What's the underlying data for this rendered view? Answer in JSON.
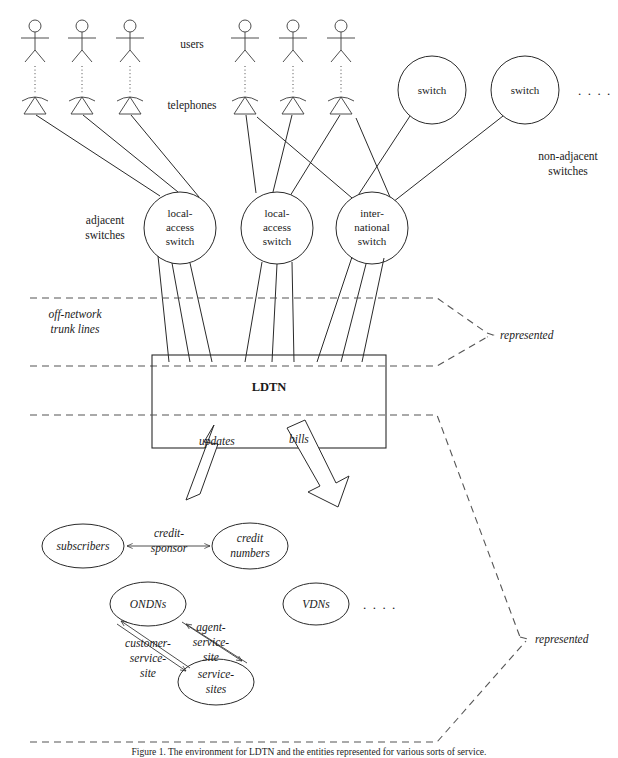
{
  "figure": {
    "caption": "Figure 1. The environment for LDTN and the entities represented for various sorts of service.",
    "title_label": "LDTN"
  },
  "labels": {
    "users": "users",
    "telephones": "telephones",
    "adjacent_switches": "adjacent\nswitches",
    "adjacent_switches_line1": "adjacent",
    "adjacent_switches_line2": "switches",
    "non_adjacent_switches_line1": "non-adjacent",
    "non_adjacent_switches_line2": "switches",
    "off_network_line1": "off-network",
    "off_network_line2": "trunk lines",
    "represented_upper": "represented",
    "represented_lower": "represented",
    "ellipsis_top": ". . . .",
    "ellipsis_bottom": ". . . ."
  },
  "switch_nodes": [
    {
      "id": "switch-1",
      "label": "switch",
      "cx": 432,
      "cy": 90,
      "r": 34
    },
    {
      "id": "switch-2",
      "label": "switch",
      "cx": 525,
      "cy": 90,
      "r": 34
    }
  ],
  "access_switches": [
    {
      "id": "local-access-switch-1",
      "cx": 180,
      "cy": 228,
      "r": 36,
      "lines": [
        "local-",
        "access",
        "switch"
      ]
    },
    {
      "id": "local-access-switch-2",
      "cx": 277,
      "cy": 228,
      "r": 36,
      "lines": [
        "local-",
        "access",
        "switch"
      ]
    },
    {
      "id": "international-switch",
      "cx": 372,
      "cy": 228,
      "r": 36,
      "lines": [
        "inter-",
        "national",
        "switch"
      ]
    }
  ],
  "user_stations": [
    {
      "id": "user-station-1",
      "x": 35
    },
    {
      "id": "user-station-2",
      "x": 82
    },
    {
      "id": "user-station-3",
      "x": 130
    },
    {
      "id": "user-station-4",
      "x": 245
    },
    {
      "id": "user-station-5",
      "x": 293
    },
    {
      "id": "user-station-6",
      "x": 341
    }
  ],
  "block_arrows": [
    {
      "id": "updates-arrow",
      "label": "updates",
      "label_x": 221,
      "label_y": 441
    },
    {
      "id": "bills-arrow",
      "label": "bills",
      "label_x": 302,
      "label_y": 439
    }
  ],
  "entity_ellipses": [
    {
      "id": "subscribers",
      "cx": 83,
      "cy": 546,
      "rx": 41,
      "ry": 22,
      "lines": [
        "subscribers"
      ]
    },
    {
      "id": "credit-numbers",
      "cx": 250,
      "cy": 546,
      "rx": 38,
      "ry": 23,
      "lines": [
        "credit",
        "numbers"
      ]
    },
    {
      "id": "ondns",
      "cx": 148,
      "cy": 604,
      "rx": 38,
      "ry": 22,
      "lines": [
        "ONDNs"
      ]
    },
    {
      "id": "vdns",
      "cx": 316,
      "cy": 604,
      "rx": 33,
      "ry": 21,
      "lines": [
        "VDNs"
      ]
    },
    {
      "id": "service-sites",
      "cx": 216,
      "cy": 682,
      "rx": 38,
      "ry": 23,
      "lines": [
        "service-",
        "sites"
      ]
    }
  ],
  "relationships": [
    {
      "id": "credit-sponsor",
      "lines": [
        "credit-",
        "sponsor"
      ],
      "x": 167,
      "y": 540
    },
    {
      "id": "customer-service-site",
      "lines": [
        "customer-",
        "service-",
        "site"
      ],
      "x": 146,
      "y": 648
    },
    {
      "id": "agent-service-site",
      "lines": [
        "agent-",
        "service-",
        "site"
      ],
      "x": 206,
      "y": 637
    }
  ],
  "colors": {
    "stroke": "#2a2a2a",
    "dashed": "#555555",
    "text": "#1a1a1a",
    "background": "#ffffff"
  }
}
